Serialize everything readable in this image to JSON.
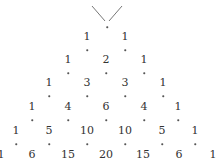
{
  "diagram": {
    "rows": [
      [
        "1",
        "1"
      ],
      [
        "1",
        "2",
        "1"
      ],
      [
        "1",
        "3",
        "3",
        "1"
      ],
      [
        "1",
        "4",
        "6",
        "4",
        "1"
      ],
      [
        "1",
        "5",
        "10",
        "10",
        "5",
        "1"
      ],
      [
        "1",
        "6",
        "15",
        "20",
        "15",
        "6",
        "1"
      ]
    ],
    "top_marker": "V-shaped lines above apex dot",
    "colors": {
      "text": "#333333",
      "lines": "#777777",
      "background": "#ffffff"
    }
  }
}
